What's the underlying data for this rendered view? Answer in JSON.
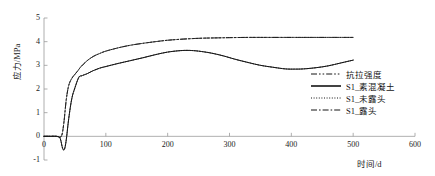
{
  "chart_data": {
    "type": "line",
    "title": "",
    "xlabel": "时间/d",
    "ylabel": "应力/MPa",
    "xlim": [
      0,
      600
    ],
    "ylim": [
      -1,
      5
    ],
    "xticks": [
      0,
      100,
      200,
      300,
      400,
      500,
      600
    ],
    "xtick_labels": [
      "0",
      "100",
      "200",
      "300",
      "400",
      "500",
      "600"
    ],
    "yticks": [
      -1,
      0,
      1,
      2,
      3,
      4,
      5
    ],
    "ytick_labels": [
      "-1",
      "0",
      "1",
      "2",
      "3",
      "4",
      "5"
    ],
    "grid": false,
    "legend_position": "center-right",
    "series": [
      {
        "name": "抗拉强度",
        "style": "dashdotdot",
        "color": "#1a1a1a",
        "x": [
          0,
          10,
          20,
          28,
          32,
          36,
          40,
          45,
          50,
          55,
          60,
          70,
          80,
          90,
          100,
          120,
          140,
          160,
          180,
          200,
          220,
          240,
          260,
          280,
          300,
          330,
          360,
          400,
          440,
          470,
          500
        ],
        "y": [
          0,
          0,
          0,
          0,
          0.55,
          1.55,
          2.15,
          2.45,
          2.62,
          2.78,
          2.95,
          3.2,
          3.38,
          3.5,
          3.6,
          3.74,
          3.85,
          3.93,
          4.0,
          4.06,
          4.1,
          4.13,
          4.15,
          4.16,
          4.17,
          4.18,
          4.18,
          4.18,
          4.18,
          4.18,
          4.18
        ]
      },
      {
        "name": "S1_素混凝土",
        "style": "solid",
        "color": "#141414",
        "x": [
          0,
          10,
          20,
          26,
          30,
          33,
          36,
          40,
          45,
          50,
          55,
          58,
          60,
          65,
          70,
          80,
          90,
          100,
          120,
          140,
          160,
          180,
          200,
          220,
          235,
          250,
          270,
          290,
          310,
          330,
          350,
          370,
          390,
          405,
          420,
          440,
          460,
          480,
          500
        ],
        "y": [
          0,
          0,
          0,
          -0.08,
          -0.5,
          -0.55,
          -0.15,
          0.75,
          1.6,
          2.05,
          2.42,
          2.55,
          2.55,
          2.6,
          2.65,
          2.78,
          2.88,
          2.95,
          3.08,
          3.2,
          3.32,
          3.45,
          3.56,
          3.62,
          3.63,
          3.6,
          3.52,
          3.4,
          3.25,
          3.12,
          3.0,
          2.92,
          2.85,
          2.84,
          2.85,
          2.9,
          2.98,
          3.1,
          3.22
        ]
      },
      {
        "name": "S1_未露头",
        "style": "dotted",
        "color": "#141414",
        "x": [
          0,
          10,
          20,
          26,
          30,
          33,
          36,
          40,
          45,
          50,
          55,
          58,
          60,
          65,
          70,
          80,
          90,
          100,
          120,
          140,
          160,
          180,
          200,
          220,
          235,
          250,
          270,
          290,
          310,
          330,
          350,
          370,
          390,
          405,
          420,
          440,
          460,
          480,
          500
        ],
        "y": [
          0,
          0,
          0,
          -0.08,
          -0.5,
          -0.55,
          -0.15,
          0.75,
          1.6,
          2.05,
          2.42,
          2.55,
          2.55,
          2.6,
          2.65,
          2.78,
          2.88,
          2.95,
          3.08,
          3.2,
          3.32,
          3.45,
          3.56,
          3.62,
          3.63,
          3.6,
          3.52,
          3.4,
          3.25,
          3.12,
          3.0,
          2.92,
          2.85,
          2.84,
          2.85,
          2.9,
          2.98,
          3.1,
          3.22
        ]
      },
      {
        "name": "S1_露头",
        "style": "dashdot",
        "color": "#1a1a1a",
        "x": [
          0,
          10,
          20,
          28,
          32,
          36,
          40,
          45,
          50,
          55,
          60,
          70,
          80,
          90,
          100,
          120,
          140,
          160,
          180,
          200,
          220,
          240,
          260,
          280,
          300,
          330,
          360,
          400,
          440,
          470,
          500
        ],
        "y": [
          0,
          0,
          0,
          0,
          0.55,
          1.55,
          2.15,
          2.45,
          2.62,
          2.78,
          2.95,
          3.2,
          3.38,
          3.5,
          3.6,
          3.74,
          3.85,
          3.93,
          4.0,
          4.06,
          4.1,
          4.13,
          4.15,
          4.16,
          4.17,
          4.18,
          4.18,
          4.18,
          4.18,
          4.18,
          4.18
        ]
      }
    ]
  },
  "legend": {
    "items": [
      {
        "label": "抗拉强度",
        "style": "dashdotdot"
      },
      {
        "label": "S1_素混凝土",
        "style": "solid"
      },
      {
        "label": "S1_未露头",
        "style": "dotted"
      },
      {
        "label": "S1_露头",
        "style": "dashdot"
      }
    ]
  },
  "axes": {
    "y_title": "应力/MPa",
    "x_title": "时间/d",
    "ytick_labels": [
      "5",
      "4",
      "3",
      "2",
      "1",
      "0",
      "-1"
    ],
    "xtick_labels": [
      "0",
      "100",
      "200",
      "300",
      "400",
      "500",
      "600"
    ]
  },
  "colors": {
    "axis": "#9a9a9a",
    "curve": "#141414",
    "text": "#1a1a1a",
    "background": "#ffffff"
  }
}
